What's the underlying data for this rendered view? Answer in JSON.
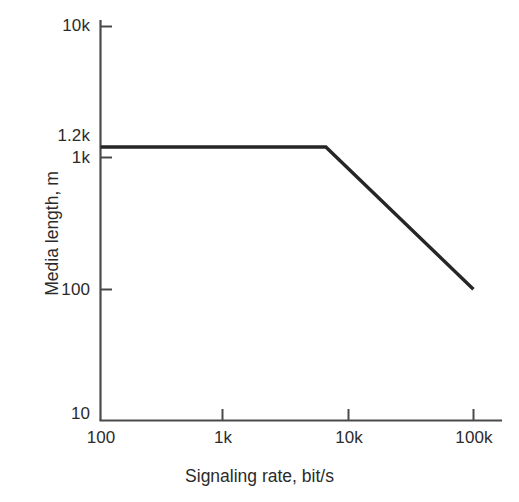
{
  "chart_data": {
    "type": "line",
    "title": "",
    "xlabel": "Signaling rate, bit/s",
    "ylabel": "Media length, m",
    "xscale": "log",
    "yscale": "log",
    "xlim": [
      100,
      160000
    ],
    "ylim": [
      10,
      10000
    ],
    "grid": false,
    "legend": null,
    "xticks": [
      {
        "value": 100,
        "label": "100"
      },
      {
        "value": 1000,
        "label": "1k"
      },
      {
        "value": 10000,
        "label": "10k"
      },
      {
        "value": 100000,
        "label": "100k"
      }
    ],
    "yticks": [
      {
        "value": 10000,
        "label": "10k"
      },
      {
        "value": 1200,
        "label": "1.2k"
      },
      {
        "value": 1000,
        "label": "1k"
      },
      {
        "value": 100,
        "label": "100"
      },
      {
        "value": 10,
        "label": "10"
      }
    ],
    "series": [
      {
        "name": "Maximum media length",
        "color": "#262626",
        "points": [
          {
            "x": 100,
            "y": 1200
          },
          {
            "x": 6500,
            "y": 1200
          },
          {
            "x": 100000,
            "y": 100
          }
        ]
      }
    ]
  },
  "axes": {
    "x_title": "Signaling rate, bit/s",
    "y_title": "Media length, m"
  },
  "colors": {
    "data_line": "#262626",
    "axis": "#4a4a4a",
    "text": "#2b2b2b",
    "background": "#ffffff"
  }
}
